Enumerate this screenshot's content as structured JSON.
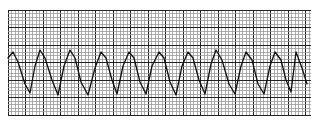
{
  "chart_data": {
    "type": "line",
    "title": "",
    "subtitle": "",
    "xlabel": "",
    "ylabel": "",
    "grid": true,
    "legend": null,
    "grid_spec": {
      "left": 8,
      "top": 10,
      "right": 311,
      "bottom": 116,
      "minor_spacing_px": 3.5,
      "major_every": 5,
      "minor_color": "#9a9a9a",
      "major_color": "#222222"
    },
    "trace_color": "#111111",
    "x": [
      8,
      13,
      18,
      25,
      30,
      35,
      40,
      45,
      52,
      58,
      64,
      70,
      75,
      81,
      88,
      95,
      101,
      106,
      112,
      117,
      123,
      129,
      134,
      140,
      146,
      152,
      159,
      164,
      170,
      176,
      182,
      188,
      193,
      199,
      205,
      211,
      216,
      222,
      229,
      235,
      241,
      246,
      252,
      258,
      264,
      270,
      275,
      281,
      286,
      291,
      296,
      302,
      307
    ],
    "values": [
      58,
      52,
      62,
      84,
      93,
      66,
      50,
      58,
      80,
      95,
      66,
      50,
      58,
      82,
      95,
      68,
      52,
      58,
      80,
      94,
      66,
      52,
      58,
      82,
      94,
      66,
      52,
      58,
      82,
      95,
      66,
      52,
      58,
      80,
      94,
      64,
      50,
      60,
      84,
      94,
      66,
      52,
      60,
      84,
      94,
      66,
      52,
      60,
      80,
      92,
      52,
      68,
      84
    ],
    "peaks_x": [
      13,
      40,
      70,
      101,
      129,
      159,
      188,
      216,
      246,
      275,
      296
    ],
    "ylim": [
      125,
      0
    ],
    "xlim": [
      0,
      316
    ]
  }
}
